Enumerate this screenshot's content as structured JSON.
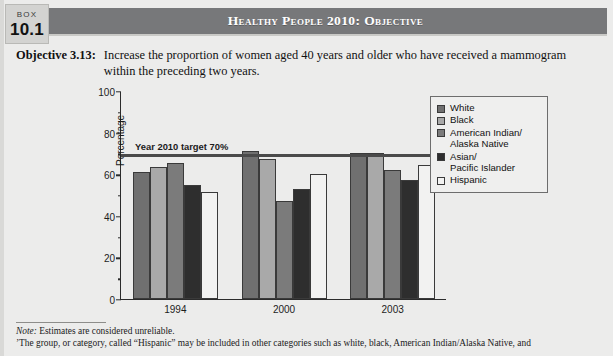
{
  "box": {
    "word": "BOX",
    "number": "10.1"
  },
  "header": {
    "title": "Healthy People 2010: Objective"
  },
  "objective": {
    "label": "Objective 3.13:",
    "text": "Increase the proportion of women aged 40 years and older who have received a mammogram within the preceding two years."
  },
  "notes": {
    "note1_prefix": "Note:",
    "note1": " Estimates are considered unreliable.",
    "note2": "’The group, or category, called “Hispanic” may be included in other categories such as white, black, American Indian/Alaska Native, and"
  },
  "legend": {
    "items": [
      {
        "label": "White",
        "color": "#707070"
      },
      {
        "label": "Black",
        "color": "#a9a9a9"
      },
      {
        "label": "American Indian/\nAlaska Native",
        "color": "#7b7b7b"
      },
      {
        "label": "Asian/\nPacific Islander",
        "color": "#2e2e2e"
      },
      {
        "label": "Hispanic",
        "color": "#f2f2f1"
      }
    ]
  },
  "chart_data": {
    "type": "bar",
    "title": "",
    "xlabel": "",
    "ylabel": "Percentage",
    "ylim": [
      0,
      100
    ],
    "yticks": [
      0,
      20,
      40,
      60,
      80,
      100
    ],
    "yticks_minor": [
      10,
      30,
      50,
      70,
      90
    ],
    "grid": false,
    "legend_position": "right",
    "categories": [
      "1994",
      "2000",
      "2003"
    ],
    "series": [
      {
        "name": "White",
        "color": "#707070",
        "values": [
          61,
          71,
          70
        ]
      },
      {
        "name": "Black",
        "color": "#a9a9a9",
        "values": [
          63.5,
          67.5,
          70
        ]
      },
      {
        "name": "American Indian/Alaska Native",
        "color": "#7b7b7b",
        "values": [
          65.5,
          47,
          62
        ]
      },
      {
        "name": "Asian/Pacific Islander",
        "color": "#2e2e2e",
        "values": [
          55,
          53,
          57
        ]
      },
      {
        "name": "Hispanic",
        "color": "#f2f2f1",
        "values": [
          51.5,
          60,
          64.5
        ]
      }
    ],
    "annotations": [
      {
        "name": "target-line",
        "label": "Year 2010 target 70%",
        "value": 70
      }
    ]
  }
}
